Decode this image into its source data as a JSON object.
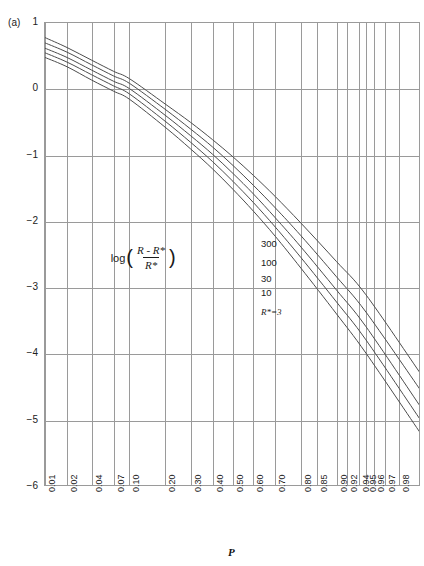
{
  "figure": {
    "panel_label": "(a)",
    "background": "#ffffff",
    "axis_color": "#9a9a9a",
    "curve_color": "#4d4d4d"
  },
  "axes": {
    "xlabel": "P",
    "ylabel_parts": {
      "log": "log",
      "open_paren": "(",
      "numerator": "R - R*",
      "denominator": "R*",
      "close_paren": ")"
    },
    "ylabel_plain": "log((R - R*)/R*)"
  },
  "chart_data": {
    "type": "line",
    "title": "",
    "subtitle": "",
    "xlabel": "P",
    "ylabel": "log((R - R*)/R*)",
    "xscale": "probability (probit)",
    "yscale": "linear",
    "xlim": [
      0.01,
      0.99
    ],
    "ylim": [
      -6,
      1
    ],
    "grid": true,
    "legend_position": "inline-right",
    "ytick_labels": [
      "1",
      "0",
      "-1",
      "-2",
      "-3",
      "-4",
      "-5",
      "-6"
    ],
    "ytick_values": [
      1,
      0,
      -1,
      -2,
      -3,
      -4,
      -5,
      -6
    ],
    "xtick_labels": [
      "0.01",
      "0.02",
      "0.04",
      "0.07",
      "0.10",
      "0.20",
      "0.30",
      "0.40",
      "0.50",
      "0.60",
      "0.70",
      "0.80",
      "0.85",
      "0.90",
      "0.92",
      "0.94",
      "0.95",
      "0.96",
      "0.97",
      "0.98",
      "0.99"
    ],
    "xtick_values": [
      0.01,
      0.02,
      0.04,
      0.07,
      0.1,
      0.2,
      0.3,
      0.4,
      0.5,
      0.6,
      0.7,
      0.8,
      0.85,
      0.9,
      0.92,
      0.94,
      0.95,
      0.96,
      0.97,
      0.98,
      0.99
    ],
    "annotations": [
      {
        "text": "300",
        "x": 0.635,
        "y": -2.33
      },
      {
        "text": "100",
        "x": 0.635,
        "y": -2.62
      },
      {
        "text": "30",
        "x": 0.635,
        "y": -2.86
      },
      {
        "text": "10",
        "x": 0.635,
        "y": -3.07
      },
      {
        "text": "R*=3",
        "x": 0.635,
        "y": -3.38
      }
    ],
    "series": [
      {
        "name": "R*=300",
        "label": "300",
        "x": [
          0.01,
          0.02,
          0.04,
          0.07,
          0.1,
          0.2,
          0.3,
          0.4,
          0.5,
          0.6,
          0.7,
          0.8,
          0.9,
          0.95,
          0.99
        ],
        "y": [
          0.78,
          0.63,
          0.44,
          0.27,
          0.16,
          -0.22,
          -0.5,
          -0.76,
          -1.02,
          -1.3,
          -1.62,
          -2.02,
          -2.6,
          -3.1,
          -4.3
        ]
      },
      {
        "name": "R*=100",
        "label": "100",
        "x": [
          0.01,
          0.02,
          0.04,
          0.07,
          0.1,
          0.2,
          0.3,
          0.4,
          0.5,
          0.6,
          0.7,
          0.8,
          0.9,
          0.95,
          0.99
        ],
        "y": [
          0.7,
          0.56,
          0.37,
          0.2,
          0.09,
          -0.3,
          -0.6,
          -0.87,
          -1.15,
          -1.45,
          -1.79,
          -2.21,
          -2.83,
          -3.36,
          -4.55
        ]
      },
      {
        "name": "R*=30",
        "label": "30",
        "x": [
          0.01,
          0.02,
          0.04,
          0.07,
          0.1,
          0.2,
          0.3,
          0.4,
          0.5,
          0.6,
          0.7,
          0.8,
          0.9,
          0.95,
          0.99
        ],
        "y": [
          0.62,
          0.48,
          0.29,
          0.12,
          0.01,
          -0.39,
          -0.7,
          -0.98,
          -1.27,
          -1.58,
          -1.94,
          -2.38,
          -3.03,
          -3.58,
          -4.8
        ]
      },
      {
        "name": "R*=10",
        "label": "10",
        "x": [
          0.01,
          0.02,
          0.04,
          0.07,
          0.1,
          0.2,
          0.3,
          0.4,
          0.5,
          0.6,
          0.7,
          0.8,
          0.9,
          0.95,
          0.99
        ],
        "y": [
          0.55,
          0.41,
          0.22,
          0.05,
          -0.07,
          -0.48,
          -0.8,
          -1.09,
          -1.39,
          -1.71,
          -2.08,
          -2.54,
          -3.21,
          -3.78,
          -5.0
        ]
      },
      {
        "name": "R*=3",
        "label": "R*=3",
        "x": [
          0.01,
          0.02,
          0.04,
          0.07,
          0.1,
          0.2,
          0.3,
          0.4,
          0.5,
          0.6,
          0.7,
          0.8,
          0.9,
          0.95,
          0.99
        ],
        "y": [
          0.48,
          0.34,
          0.14,
          -0.03,
          -0.15,
          -0.57,
          -0.9,
          -1.2,
          -1.51,
          -1.84,
          -2.22,
          -2.7,
          -3.39,
          -3.98,
          -5.2
        ]
      }
    ]
  }
}
